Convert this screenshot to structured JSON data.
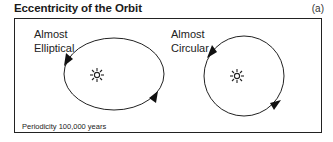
{
  "header": {
    "title": "Eccentricity of the Orbit",
    "panel_label": "(a)"
  },
  "orbits": [
    {
      "shape": "ellipse",
      "label_line1": "Almost",
      "label_line2": "Elliptical",
      "icon": "sun-icon"
    },
    {
      "shape": "circle",
      "label_line1": "Almost",
      "label_line2": "Circular",
      "icon": "sun-icon"
    }
  ],
  "footer": {
    "periodicity": "Periodicity 100,000 years"
  },
  "colors": {
    "line": "#222222",
    "background": "#ffffff"
  }
}
